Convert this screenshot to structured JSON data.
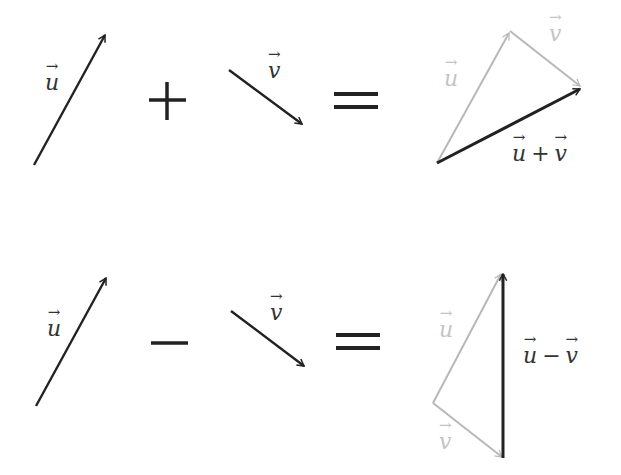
{
  "colors": {
    "primary": "#222222",
    "faded": "#b8b8b8",
    "background": "#ffffff"
  },
  "rows": [
    {
      "name": "addition",
      "left_vector": {
        "symbol": "u"
      },
      "operator": "+",
      "right_vector": {
        "symbol": "v"
      },
      "equals": "=",
      "result": {
        "faded_labels": [
          "u",
          "v"
        ],
        "result_label": {
          "a": "u",
          "op": "+",
          "b": "v"
        }
      }
    },
    {
      "name": "subtraction",
      "left_vector": {
        "symbol": "u"
      },
      "operator": "−",
      "right_vector": {
        "symbol": "v"
      },
      "equals": "=",
      "result": {
        "faded_labels": [
          "u",
          "v"
        ],
        "result_label": {
          "a": "u",
          "op": "−",
          "b": "v"
        }
      }
    }
  ]
}
